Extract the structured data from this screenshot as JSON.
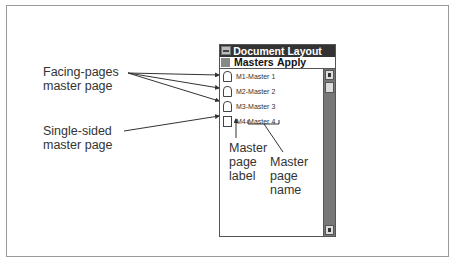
{
  "window": {
    "title": "Document Layout",
    "menus": [
      "Masters",
      "Apply"
    ]
  },
  "master_pages": [
    {
      "label": "M1",
      "name": "Master 1",
      "text": "M1-Master 1",
      "type": "facing"
    },
    {
      "label": "M2",
      "name": "Master 2",
      "text": "M2-Master 2",
      "type": "facing"
    },
    {
      "label": "M3",
      "name": "Master 3",
      "text": "M3-Master 3",
      "type": "facing"
    },
    {
      "label": "M4",
      "name": "Master 4",
      "text": "M4-Master 4",
      "type": "single"
    }
  ],
  "callouts": {
    "facing_line1": "Facing-pages",
    "facing_line2": "master page",
    "single_line1": "Single-sided",
    "single_line2": "master page",
    "label_line1": "Master",
    "label_line2": "page",
    "label_line3": "label",
    "name_line1": "Master",
    "name_line2": "page",
    "name_line3": "name"
  }
}
